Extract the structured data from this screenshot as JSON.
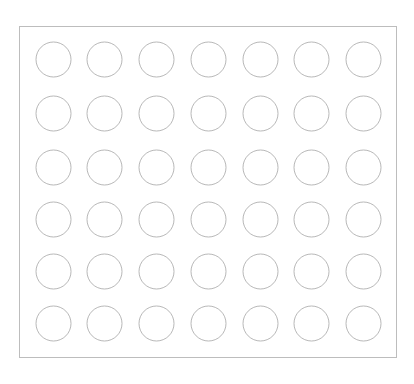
{
  "grid": {
    "rows": 6,
    "columns": 7,
    "circle_radius": 17.5,
    "column_centers": [
      53.5,
      104.5,
      156.5,
      208.5,
      260.5,
      311.5,
      363.5
    ],
    "row_centers": [
      59.5,
      113.5,
      167.5,
      219.5,
      271.5,
      323.5
    ],
    "stroke_color": "#b8b8b8",
    "fill_color": "#ffffff",
    "frame_color": "#bdbdbd",
    "cells": [
      [
        "empty",
        "empty",
        "empty",
        "empty",
        "empty",
        "empty",
        "empty"
      ],
      [
        "empty",
        "empty",
        "empty",
        "empty",
        "empty",
        "empty",
        "empty"
      ],
      [
        "empty",
        "empty",
        "empty",
        "empty",
        "empty",
        "empty",
        "empty"
      ],
      [
        "empty",
        "empty",
        "empty",
        "empty",
        "empty",
        "empty",
        "empty"
      ],
      [
        "empty",
        "empty",
        "empty",
        "empty",
        "empty",
        "empty",
        "empty"
      ],
      [
        "empty",
        "empty",
        "empty",
        "empty",
        "empty",
        "empty",
        "empty"
      ]
    ]
  }
}
